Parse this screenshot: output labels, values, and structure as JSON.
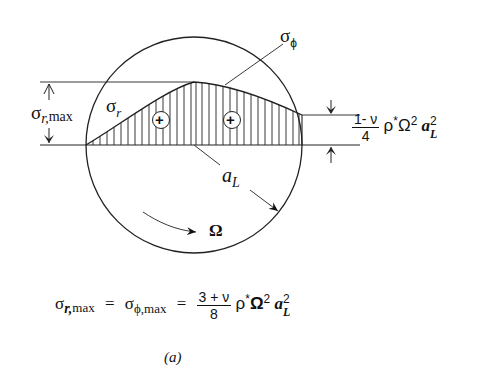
{
  "figure": {
    "caption": "(a)",
    "labels": {
      "sigma_phi": {
        "sym": "σ",
        "sub": "ϕ"
      },
      "sigma_r": {
        "sym": "σ",
        "sub": "r"
      },
      "sigma_r_max": {
        "sym": "σ",
        "sub": "r,",
        "sub2": "max"
      },
      "radius": {
        "sym": "a",
        "sub": "L"
      },
      "omega": "Ω",
      "plus_left": "+",
      "plus_right": "+"
    },
    "edge_value": {
      "num": "1- ν",
      "den": "4",
      "rest_rho": "ρ",
      "rest_star": "*",
      "rest_omega": "Ω",
      "rest_omega_exp": "2",
      "rest_a": "a",
      "rest_a_sub": "L",
      "rest_a_exp": "2"
    },
    "equation": {
      "lhs_sym": "σ",
      "lhs_sub": "r,",
      "lhs_sub2": "max",
      "eq1": "=",
      "mid_sym": "σ",
      "mid_sub": "ϕ,max",
      "eq2": "=",
      "num": "3 + ν",
      "den": "8",
      "rho": "ρ",
      "star": "*",
      "omega": "Ω",
      "omega_exp": "2",
      "a": "a",
      "a_sub": "L",
      "a_exp": "2"
    }
  }
}
